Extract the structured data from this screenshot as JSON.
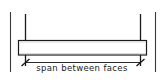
{
  "diagram": {
    "kind": "structural-beam-span-dimension-sketch",
    "title": "span between faces",
    "dimension": {
      "label": "span between faces",
      "start_x": 25,
      "end_x": 140,
      "line_y": 62,
      "terminator": "architectural-tick",
      "text_position": "below-line-centered"
    },
    "beam": {
      "name": "beam",
      "left": 18,
      "top": 40,
      "width": 129,
      "height": 15,
      "fill": "#ffffff",
      "stroke": "#1a1a1a",
      "stroke_width": 1
    },
    "support_faces": [
      {
        "name": "left-support-face-line",
        "x": 25,
        "top": 14,
        "bottom": 66
      },
      {
        "name": "right-support-face-line",
        "x": 140,
        "top": 14,
        "bottom": 66
      }
    ],
    "extension_lines": [
      {
        "name": "left-outer-extension-line",
        "x": 10,
        "top": 12,
        "bottom": 72
      },
      {
        "name": "right-outer-extension-line",
        "x": 155,
        "top": 12,
        "bottom": 72
      }
    ],
    "colors": {
      "ink": "#1a1a1a",
      "light_ink": "#4a4a4a",
      "paper": "#ffffff",
      "beam_shade": "#efefef"
    }
  }
}
